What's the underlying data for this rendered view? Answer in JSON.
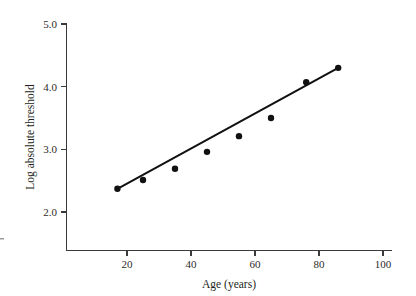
{
  "chart_data": {
    "type": "scatter",
    "title": "",
    "xlabel": "Age (years)",
    "ylabel": "Log absolute threshold",
    "xlim": [
      0,
      103
    ],
    "ylim": [
      1.7,
      5.1
    ],
    "xticks": [
      20,
      40,
      60,
      80,
      100
    ],
    "xtick_labels": [
      "20",
      "40",
      "60",
      "80",
      "100"
    ],
    "yticks": [
      2.0,
      3.0,
      4.0,
      5.0
    ],
    "ytick_labels": [
      "2.0",
      "3.0",
      "4.0",
      "5.0"
    ],
    "grid": false,
    "legend": null,
    "series": [
      {
        "name": "Log absolute threshold vs age",
        "marker": "filled-circle",
        "color": "#111111",
        "x": [
          17,
          25,
          35,
          45,
          55,
          65,
          76,
          86
        ],
        "y": [
          2.37,
          2.51,
          2.69,
          2.96,
          3.21,
          3.5,
          4.07,
          4.3
        ]
      },
      {
        "name": "fitted regression line",
        "type": "line",
        "color": "#111111",
        "x": [
          17,
          86
        ],
        "y": [
          2.37,
          4.3
        ]
      }
    ]
  },
  "axes": {
    "x_axis_name": "Age (years)",
    "y_axis_name": "Log absolute threshold"
  },
  "marks": {
    "left_edge_tick": ""
  }
}
